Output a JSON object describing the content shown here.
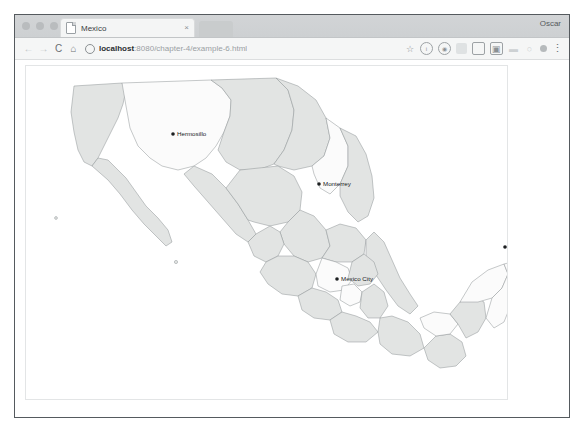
{
  "window": {
    "profile_name": "Oscar",
    "traffic_lights": [
      "close",
      "minimize",
      "maximize"
    ]
  },
  "tab": {
    "title": "Mexico",
    "favicon": "page-icon",
    "close_glyph": "×"
  },
  "toolbar": {
    "back_glyph": "←",
    "forward_glyph": "→",
    "reload_glyph": "C",
    "home_glyph": "⌂",
    "site_info_icon": "info-circle-icon",
    "url_host": "localhost",
    "url_rest": ":8080/chapter-4/example-6.html",
    "url_full": "localhost:8080/chapter-4/example-6.html",
    "bookmark_glyph": "☆",
    "menu_glyph": "⋮",
    "extension_icons": [
      "bookmark-star-icon",
      "info-circle-icon",
      "globe-circle-icon",
      "extension-blob-icon",
      "square-outline-icon",
      "screenshot-icon",
      "faint-icon-a",
      "faint-icon-b",
      "avatar-dot-icon"
    ]
  },
  "map": {
    "title": "Mexico",
    "colors": {
      "state_light": "#fbfbfb",
      "state_shade": "#e2e4e3",
      "state_stroke": "#8d9295",
      "marker": "#1c1f21",
      "label": "#17191b",
      "page_background": "#ffffff"
    },
    "cities": [
      {
        "name": "Hermosillo",
        "x": 147,
        "y": 68,
        "label_dx": 4,
        "label_dy": 2.2
      },
      {
        "name": "Monterrey",
        "x": 293,
        "y": 118,
        "label_dx": 4,
        "label_dy": 2.2
      },
      {
        "name": "Mexico City",
        "x": 311,
        "y": 213,
        "label_dx": 4,
        "label_dy": 2.2
      },
      {
        "name": "Cancun",
        "x": 479,
        "y": 181,
        "label_dx": 4,
        "label_dy": 2.2
      }
    ]
  }
}
